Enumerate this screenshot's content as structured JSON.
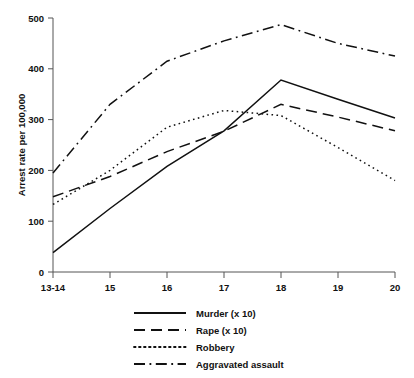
{
  "chart_data": {
    "type": "line",
    "title": "",
    "subtitle": "",
    "xlabel": "",
    "ylabel": "Arrest rate per 100,000",
    "categories": [
      "13-14",
      "15",
      "16",
      "17",
      "18",
      "19",
      "20"
    ],
    "x_tick_labels": [
      "13-14",
      "15",
      "16",
      "17",
      "18",
      "19",
      "20"
    ],
    "y_tick_labels": [
      "0",
      "100",
      "200",
      "300",
      "400",
      "500"
    ],
    "y_ticks": [
      0,
      100,
      200,
      300,
      400,
      500
    ],
    "ylim": [
      0,
      500
    ],
    "grid": false,
    "legend_position": "bottom",
    "series": [
      {
        "name": "Murder (x 10)",
        "style": "solid",
        "color": "#111111",
        "values": [
          38,
          125,
          208,
          278,
          378,
          340,
          303
        ]
      },
      {
        "name": "Rape (x 10)",
        "style": "dashed",
        "color": "#111111",
        "values": [
          148,
          188,
          237,
          277,
          330,
          305,
          278
        ]
      },
      {
        "name": "Robbery",
        "style": "dotted",
        "color": "#111111",
        "values": [
          133,
          200,
          285,
          318,
          308,
          245,
          180
        ]
      },
      {
        "name": "Aggravated assault",
        "style": "dash-dot",
        "color": "#111111",
        "values": [
          195,
          330,
          415,
          455,
          487,
          450,
          425
        ]
      }
    ]
  },
  "legend": {
    "entries": [
      {
        "label": "Murder (x 10)"
      },
      {
        "label": "Rape (x 10)"
      },
      {
        "label": "Robbery"
      },
      {
        "label": "Aggravated assault"
      }
    ]
  },
  "axes": {
    "y_axis_title": "Arrest rate per 100,000",
    "y_labels": [
      "500",
      "400",
      "300",
      "200",
      "100",
      "0"
    ],
    "x_labels": [
      "13-14",
      "15",
      "16",
      "17",
      "18",
      "19",
      "20"
    ]
  },
  "colors": {
    "background": "#ffffff",
    "ink": "#111111",
    "axis": "#555555"
  }
}
